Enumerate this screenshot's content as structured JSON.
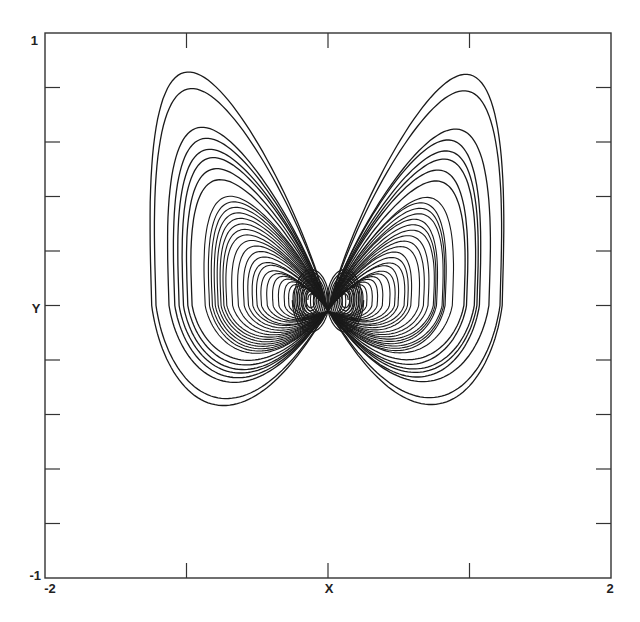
{
  "chart_data": {
    "type": "line",
    "title": "",
    "xlabel": "X",
    "ylabel": "Y",
    "xlim": [
      -2,
      2
    ],
    "ylim": [
      -1,
      1
    ],
    "grid": false,
    "legend": null,
    "x_tick_labels": [
      {
        "value": -2,
        "label": "-2"
      },
      {
        "value": 2,
        "label": "2"
      }
    ],
    "y_tick_labels": [
      {
        "value": 1,
        "label": "1"
      },
      {
        "value": -1,
        "label": "-1"
      }
    ],
    "x_ticks": [
      -1,
      0,
      1
    ],
    "y_ticks": [
      0.8,
      0.6,
      0.4,
      0.2,
      0,
      -0.2,
      -0.4,
      -0.6,
      -0.8
    ],
    "line_color": "#1a1a1a",
    "extents": {
      "x_min": -1.22,
      "x_max": 1.22,
      "y_max": 0.85,
      "y_min": -0.28
    },
    "cusp": {
      "x": 0.0,
      "y": -0.02
    },
    "loops": {
      "widths": [
        1.22,
        1.19,
        1.1,
        1.06,
        1.03,
        1.0,
        0.97,
        0.94,
        0.85,
        0.82,
        0.8,
        0.78,
        0.76,
        0.74,
        0.72,
        0.7,
        0.66,
        0.62,
        0.58,
        0.55,
        0.52,
        0.49,
        0.46,
        0.42,
        0.38,
        0.34,
        0.3,
        0.27,
        0.24,
        0.21,
        0.18,
        0.15,
        0.12,
        0.1
      ],
      "heights": [
        0.85,
        0.79,
        0.65,
        0.61,
        0.57,
        0.54,
        0.5,
        0.46,
        0.4,
        0.38,
        0.36,
        0.34,
        0.32,
        0.3,
        0.28,
        0.26,
        0.24,
        0.22,
        0.2,
        0.18,
        0.16,
        0.15,
        0.13,
        0.12,
        0.11,
        0.1,
        0.09,
        0.08,
        0.075,
        0.07,
        0.065,
        0.06,
        0.055,
        0.05
      ]
    }
  }
}
